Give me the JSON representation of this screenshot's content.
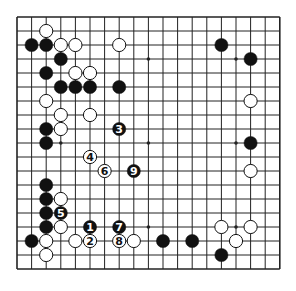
{
  "board": {
    "size": 19,
    "origin": {
      "x": 17,
      "y": 17
    },
    "spacing": {
      "x": 14.6,
      "y": 14.0
    },
    "colors": {
      "line": "#222222",
      "black": "#111111",
      "white": "#ffffff",
      "background": "#ffffff"
    },
    "star_points": [
      [
        3,
        3
      ],
      [
        9,
        3
      ],
      [
        15,
        3
      ],
      [
        3,
        9
      ],
      [
        9,
        9
      ],
      [
        15,
        9
      ],
      [
        3,
        15
      ],
      [
        9,
        15
      ],
      [
        15,
        15
      ]
    ],
    "stones": [
      {
        "c": "w",
        "x": 2,
        "y": 1
      },
      {
        "c": "b",
        "x": 1,
        "y": 2
      },
      {
        "c": "b",
        "x": 2,
        "y": 2
      },
      {
        "c": "w",
        "x": 3,
        "y": 2
      },
      {
        "c": "w",
        "x": 4,
        "y": 2
      },
      {
        "c": "w",
        "x": 7,
        "y": 2
      },
      {
        "c": "b",
        "x": 14,
        "y": 2
      },
      {
        "c": "b",
        "x": 3,
        "y": 3
      },
      {
        "c": "b",
        "x": 16,
        "y": 3
      },
      {
        "c": "b",
        "x": 2,
        "y": 4
      },
      {
        "c": "w",
        "x": 4,
        "y": 4
      },
      {
        "c": "w",
        "x": 5,
        "y": 4
      },
      {
        "c": "b",
        "x": 3,
        "y": 5
      },
      {
        "c": "b",
        "x": 4,
        "y": 5
      },
      {
        "c": "b",
        "x": 5,
        "y": 5
      },
      {
        "c": "b",
        "x": 7,
        "y": 5
      },
      {
        "c": "w",
        "x": 2,
        "y": 6
      },
      {
        "c": "w",
        "x": 16,
        "y": 6
      },
      {
        "c": "w",
        "x": 3,
        "y": 7
      },
      {
        "c": "w",
        "x": 5,
        "y": 7
      },
      {
        "c": "b",
        "x": 2,
        "y": 8
      },
      {
        "c": "w",
        "x": 3,
        "y": 8
      },
      {
        "c": "b",
        "x": 2,
        "y": 9
      },
      {
        "c": "b",
        "x": 16,
        "y": 9
      },
      {
        "c": "w",
        "x": 16,
        "y": 11
      },
      {
        "c": "b",
        "x": 2,
        "y": 12
      },
      {
        "c": "b",
        "x": 2,
        "y": 13
      },
      {
        "c": "w",
        "x": 3,
        "y": 13
      },
      {
        "c": "b",
        "x": 2,
        "y": 14
      },
      {
        "c": "b",
        "x": 2,
        "y": 15
      },
      {
        "c": "w",
        "x": 3,
        "y": 15
      },
      {
        "c": "w",
        "x": 14,
        "y": 15
      },
      {
        "c": "w",
        "x": 16,
        "y": 15
      },
      {
        "c": "b",
        "x": 1,
        "y": 16
      },
      {
        "c": "w",
        "x": 2,
        "y": 16
      },
      {
        "c": "w",
        "x": 4,
        "y": 16
      },
      {
        "c": "w",
        "x": 8,
        "y": 16
      },
      {
        "c": "b",
        "x": 10,
        "y": 16
      },
      {
        "c": "b",
        "x": 12,
        "y": 16
      },
      {
        "c": "w",
        "x": 15,
        "y": 16
      },
      {
        "c": "w",
        "x": 2,
        "y": 17
      },
      {
        "c": "b",
        "x": 14,
        "y": 17
      }
    ],
    "moves": [
      {
        "n": "1",
        "c": "b",
        "x": 5,
        "y": 15
      },
      {
        "n": "2",
        "c": "w",
        "x": 5,
        "y": 16
      },
      {
        "n": "3",
        "c": "b",
        "x": 7,
        "y": 8
      },
      {
        "n": "4",
        "c": "w",
        "x": 5,
        "y": 10
      },
      {
        "n": "5",
        "c": "b",
        "x": 3,
        "y": 14
      },
      {
        "n": "6",
        "c": "w",
        "x": 6,
        "y": 11
      },
      {
        "n": "7",
        "c": "b",
        "x": 7,
        "y": 15
      },
      {
        "n": "8",
        "c": "w",
        "x": 7,
        "y": 16
      },
      {
        "n": "9",
        "c": "b",
        "x": 8,
        "y": 11
      }
    ]
  }
}
